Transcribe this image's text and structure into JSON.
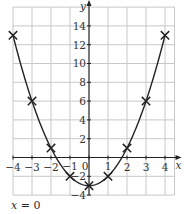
{
  "chart_data": {
    "type": "line",
    "title": "",
    "equation": "y = x^2 - 3",
    "xlabel": "x",
    "ylabel": "y",
    "xlim": [
      -4,
      4.5
    ],
    "ylim": [
      -4,
      16
    ],
    "grid": true,
    "x_ticks": [
      -4,
      -3,
      -2,
      -1,
      0,
      1,
      2,
      3,
      4
    ],
    "x_tick_labels": [
      "−4",
      "−3",
      "−2",
      "−1",
      "0",
      "1",
      "2",
      "3",
      "4"
    ],
    "y_ticks": [
      -4,
      -2,
      2,
      4,
      6,
      8,
      10,
      12,
      14
    ],
    "y_tick_labels": [
      "−4",
      "−2",
      "2",
      "4",
      "6",
      "8",
      "10",
      "12",
      "14"
    ],
    "series": [
      {
        "name": "y = x² − 3",
        "marker": "x",
        "x": [
          -4,
          -3,
          -2,
          -1,
          0,
          1,
          2,
          3,
          4
        ],
        "y": [
          13,
          6,
          1,
          -2,
          -3,
          -2,
          1,
          6,
          13
        ]
      }
    ],
    "colors": {
      "curve": "#222222",
      "grid": "#c8c8c8",
      "axis": "#222222",
      "text": "#333333"
    },
    "annotation": "x = 0"
  },
  "caption": {
    "lhs": "x",
    "rhs": "= 0"
  }
}
